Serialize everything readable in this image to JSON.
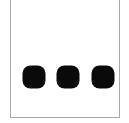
{
  "figure": {
    "background_color": "#ffffff",
    "canvas": {
      "width": 129,
      "height": 123
    }
  },
  "panel": {
    "name": "bordered-panel",
    "fill_color": "#ffffff",
    "border_color": "#a8a8a8",
    "border_width_px": 1,
    "left_px": 10,
    "right_px": 120,
    "bottom_px": 117,
    "top_cropped": true
  },
  "marks": {
    "count": 3,
    "shape": "rounded-square",
    "color": "#0a0a0a",
    "diameter_px": 23,
    "corner_radius_pct": 35,
    "row_center_y_px": 77,
    "items": [
      {
        "label": "dot-1",
        "cx": 33,
        "cy": 77
      },
      {
        "label": "dot-2",
        "cx": 67,
        "cy": 77
      },
      {
        "label": "dot-3",
        "cx": 102,
        "cy": 77
      }
    ]
  }
}
